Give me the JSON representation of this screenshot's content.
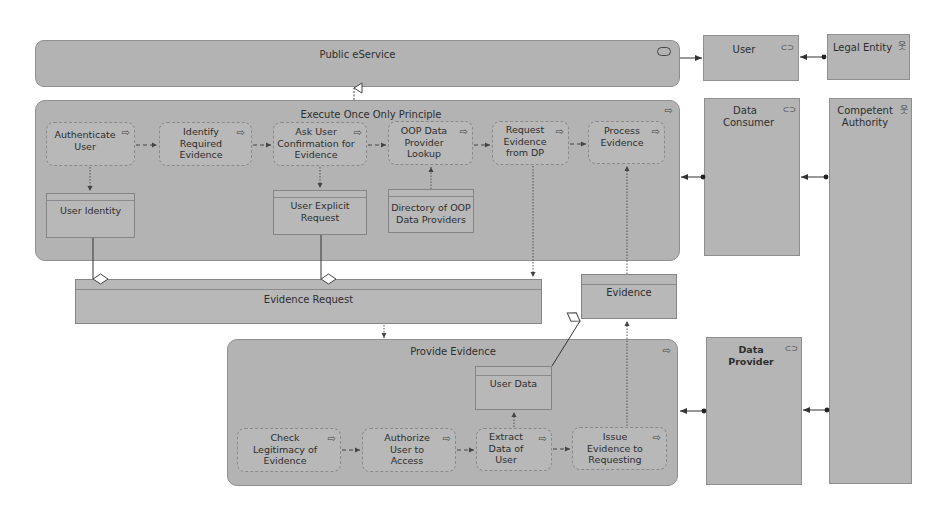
{
  "diagram": {
    "service": {
      "label": "Public eService",
      "icon": "service-icon"
    },
    "roles": {
      "user": {
        "label": "User",
        "icon": "role-icon"
      },
      "data_consumer": {
        "label": "Data Consumer",
        "icon": "role-icon"
      },
      "data_provider": {
        "label": "Data Provider",
        "icon": "role-icon"
      }
    },
    "actors": {
      "legal_entity": {
        "label": "Legal Entity",
        "icon": "actor-icon"
      },
      "competent_authority": {
        "label": "Competent Authority",
        "icon": "actor-icon"
      }
    },
    "oop_process": {
      "label": "Execute Once Only Principle",
      "steps": [
        {
          "label": "Authenticate User"
        },
        {
          "label": "Identify Required Evidence"
        },
        {
          "label": "Ask User Confirmation for Evidence"
        },
        {
          "label": "OOP Data Provider Lookup"
        },
        {
          "label": "Request Evidence from DP"
        },
        {
          "label": "Process Evidence"
        }
      ],
      "objects": [
        {
          "label": "User Identity"
        },
        {
          "label": "User Explicit Request"
        },
        {
          "label": "Directory of OOP Data Providers"
        }
      ]
    },
    "evidence_request": {
      "label": "Evidence Request"
    },
    "evidence": {
      "label": "Evidence"
    },
    "provide_process": {
      "label": "Provide Evidence",
      "steps": [
        {
          "label": "Check Legitimacy of Evidence"
        },
        {
          "label": "Authorize User to Access"
        },
        {
          "label": "Extract Data of User"
        },
        {
          "label": "Issue Evidence to Requesting"
        }
      ],
      "objects": [
        {
          "label": "User Data"
        }
      ]
    },
    "icons": {
      "process": "⇨",
      "service": "⬭",
      "role": "⊂⊃",
      "actor": "웃"
    }
  }
}
